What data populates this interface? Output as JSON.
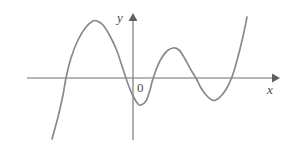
{
  "figure": {
    "type": "coordinate-plane-graph",
    "background_color": "#ffffff",
    "width": 290,
    "height": 145
  },
  "labels": {
    "y_axis": "y",
    "x_axis": "x",
    "origin": "0"
  },
  "colors": {
    "curve": "#8a8a8a",
    "axis": "#6e6e6e",
    "text": "#4a4a4a"
  },
  "chart_data": {
    "type": "line",
    "title": "",
    "xlabel": "x",
    "ylabel": "y",
    "grid": false,
    "legend": null,
    "annotations": [
      "0"
    ],
    "axes": {
      "x_axis_pixel_y": 78,
      "y_axis_pixel_x": 133,
      "x_axis_from_px": 27,
      "x_axis_to_px": 278,
      "y_axis_from_px": 14,
      "y_axis_to_px": 140,
      "x_arrow": "right",
      "y_arrow": "up"
    },
    "roots_px": [
      66,
      121,
      152,
      199,
      236
    ],
    "local_maxima_px": [
      [
        97,
        21
      ],
      [
        173,
        48
      ]
    ],
    "local_minima_px": [
      [
        141,
        105
      ],
      [
        215,
        100
      ]
    ],
    "endpoints_px": [
      [
        52,
        139
      ],
      [
        247,
        17
      ]
    ],
    "path_points_px": [
      [
        52,
        139
      ],
      [
        58,
        117
      ],
      [
        63,
        95
      ],
      [
        66,
        78
      ],
      [
        71,
        58
      ],
      [
        78,
        40
      ],
      [
        86,
        27
      ],
      [
        93,
        21
      ],
      [
        97,
        21
      ],
      [
        103,
        25
      ],
      [
        110,
        36
      ],
      [
        117,
        51
      ],
      [
        121,
        63
      ],
      [
        124,
        72
      ],
      [
        128,
        84
      ],
      [
        133,
        96
      ],
      [
        138,
        104
      ],
      [
        141,
        105
      ],
      [
        146,
        101
      ],
      [
        150,
        90
      ],
      [
        152,
        82
      ],
      [
        156,
        70
      ],
      [
        161,
        59
      ],
      [
        167,
        51
      ],
      [
        173,
        48
      ],
      [
        179,
        50
      ],
      [
        185,
        59
      ],
      [
        191,
        70
      ],
      [
        196,
        78
      ],
      [
        201,
        88
      ],
      [
        207,
        96
      ],
      [
        212,
        100
      ],
      [
        216,
        100
      ],
      [
        222,
        95
      ],
      [
        228,
        86
      ],
      [
        233,
        74
      ],
      [
        236,
        64
      ],
      [
        240,
        49
      ],
      [
        244,
        32
      ],
      [
        247,
        17
      ]
    ]
  }
}
